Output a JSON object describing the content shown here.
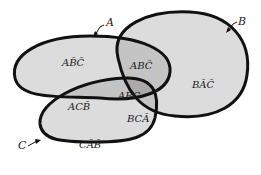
{
  "diagram": {
    "type": "venn-3-set",
    "background": "#ffffff",
    "colors": {
      "outline": "#111111",
      "single_region": "#dcdcdc",
      "double_region": "#c4c4c4",
      "triple_region": "#a9a9a9"
    },
    "sets": [
      {
        "name": "A",
        "label": "A"
      },
      {
        "name": "B",
        "label": "B"
      },
      {
        "name": "C",
        "label": "C"
      }
    ],
    "regions": {
      "a_only": "AB̄C̄",
      "ab_only": "ABC̄",
      "b_only": "BĀC̄",
      "ac_only": "ACB̄",
      "abc": "ABC",
      "bc_only": "BCĀ",
      "c_only": "CĀB̄"
    }
  }
}
